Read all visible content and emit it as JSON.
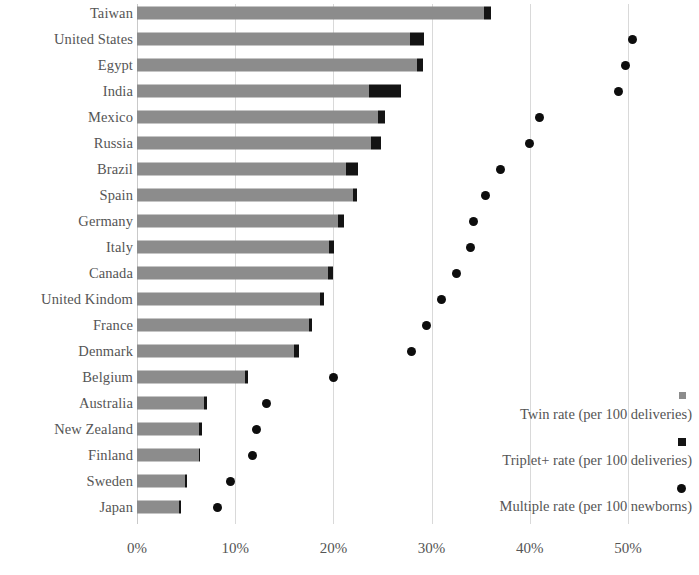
{
  "chart_data": {
    "type": "bar",
    "title": "",
    "subtitle": "",
    "xlabel": "",
    "ylabel": "",
    "orientation": "horizontal",
    "xlim": [
      0,
      50
    ],
    "xtick_labels": [
      "0%",
      "10%",
      "20%",
      "30%",
      "40%",
      "50%"
    ],
    "xticks": [
      0,
      10,
      20,
      30,
      40,
      50
    ],
    "grid": "vertical",
    "stacked": true,
    "legend_position": "bottom-right",
    "categories": [
      "Taiwan",
      "United States",
      "Egypt",
      "India",
      "Mexico",
      "Russia",
      "Brazil",
      "Spain",
      "Germany",
      "Italy",
      "Canada",
      "United Kindom",
      "France",
      "Denmark",
      "Belgium",
      "Australia",
      "New Zealand",
      "Finland",
      "Sweden",
      "Japan"
    ],
    "series": [
      {
        "name": "Twin rate (per 100 deliveries)",
        "marker": "square",
        "color": "#8c8c8c",
        "type": "bar",
        "values": [
          35.3,
          27.8,
          28.5,
          23.6,
          24.5,
          23.8,
          21.3,
          22.0,
          20.5,
          19.6,
          19.4,
          18.6,
          17.5,
          16.0,
          11.0,
          6.8,
          6.3,
          6.3,
          4.9,
          4.3
        ]
      },
      {
        "name": "Triplet+ rate (per 100 deliveries)",
        "marker": "square",
        "color": "#141414",
        "type": "bar",
        "values": [
          0.7,
          1.4,
          0.6,
          3.3,
          0.8,
          1.0,
          1.2,
          0.4,
          0.6,
          0.5,
          0.6,
          0.4,
          0.3,
          0.5,
          0.3,
          0.3,
          0.3,
          0.1,
          0.1,
          0.1
        ]
      },
      {
        "name": "Multiple rate (per 100 newborns)",
        "marker": "circle",
        "color": "#0d0d0d",
        "type": "scatter",
        "values": [
          null,
          50.5,
          49.7,
          49.0,
          41.0,
          40.0,
          37.0,
          35.5,
          34.3,
          34.0,
          32.5,
          31.0,
          29.5,
          28.0,
          20.0,
          13.2,
          12.2,
          11.8,
          9.5,
          8.2
        ]
      }
    ]
  },
  "legend": {
    "items": [
      {
        "label": "Twin rate (per 100 deliveries)",
        "marker": "square-gray"
      },
      {
        "label": "Triplet+ rate (per 100 deliveries)",
        "marker": "square-black"
      },
      {
        "label": "Multiple rate (per 100 newborns)",
        "marker": "circle-black"
      }
    ]
  },
  "colors": {
    "twin": "#8c8c8c",
    "triplet": "#141414",
    "multiple": "#0d0d0d",
    "grid": "#d9d9d9",
    "text": "#555555",
    "background": "#ffffff"
  }
}
